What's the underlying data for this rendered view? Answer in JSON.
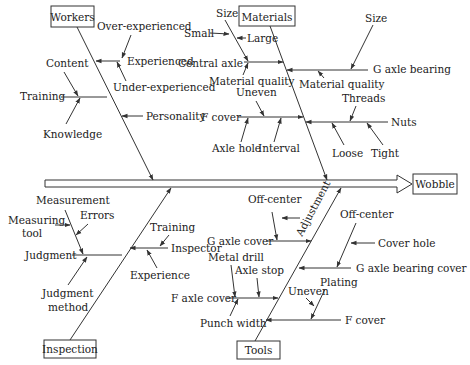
{
  "effect": {
    "label": "Wobble"
  },
  "categories": {
    "workers": {
      "label": "Workers",
      "causes": {
        "experienced": {
          "label": "Experienced",
          "subs": [
            "Over-experienced",
            "Under-experienced"
          ]
        },
        "training": {
          "label": "Training",
          "subs": [
            "Content",
            "Knowledge"
          ]
        },
        "personality": {
          "label": "Personality"
        }
      }
    },
    "materials": {
      "label": "Materials",
      "causes": {
        "central_axle": {
          "label": "Central axle",
          "subs": [
            "Size",
            "Small",
            "Large",
            "Material quality"
          ]
        },
        "g_axle_bearing": {
          "label": "G axle bearing",
          "subs": [
            "Size",
            "Material quality"
          ]
        },
        "f_cover": {
          "label": "F cover",
          "subs": [
            "Uneven",
            "Axle hole",
            "Interval"
          ]
        },
        "nuts": {
          "label": "Nuts",
          "subs": [
            "Threads",
            "Loose",
            "Tight"
          ]
        }
      }
    },
    "inspection": {
      "label": "Inspection",
      "causes": {
        "judgment": {
          "label": "Judgment",
          "subs": [
            "Measurement",
            "Measuring tool",
            "Errors",
            "Judgment method"
          ],
          "subs_lines": [
            "Measuring",
            "tool",
            "Judgment",
            "method"
          ]
        },
        "inspector": {
          "label": "Inspector",
          "subs": [
            "Training",
            "Experience"
          ]
        }
      }
    },
    "tools": {
      "label": "Tools",
      "bone_label": "Adjustment",
      "causes": {
        "g_axle_cover": {
          "label": "G axle cover",
          "subs": [
            "Off-center"
          ]
        },
        "f_axle_cover": {
          "label": "F axle cover",
          "subs": [
            "Metal drill",
            "Axle stop",
            "Punch width"
          ]
        },
        "g_axle_bearing_cover": {
          "label": "G axle bearing cover",
          "subs": [
            "Off-center",
            "Cover hole"
          ]
        },
        "f_cover": {
          "label": "F cover",
          "subs": [
            "Uneven",
            "Plating"
          ]
        }
      }
    }
  }
}
